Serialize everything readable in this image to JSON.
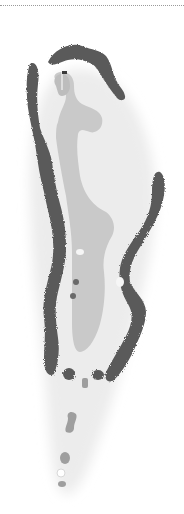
{
  "diagram": {
    "type": "golf-hole-layout",
    "colors": {
      "background": "#ffffff",
      "rough": "#ececec",
      "fairway": "#c9c9c9",
      "green": "#bdbdbd",
      "trees": "#5a5a5a",
      "bunker": "#f6f6f6",
      "tee": "#9e9e9e",
      "flagstick": "#ffffff",
      "cup": "#3a3a3a",
      "divider": "#9a9a9a"
    },
    "features": [
      {
        "name": "green"
      },
      {
        "name": "fairway"
      },
      {
        "name": "tree-line-left"
      },
      {
        "name": "tree-line-right"
      },
      {
        "name": "tree-line-top"
      },
      {
        "name": "fairway-bunkers"
      },
      {
        "name": "tee-boxes"
      },
      {
        "name": "pin-flag"
      }
    ]
  }
}
